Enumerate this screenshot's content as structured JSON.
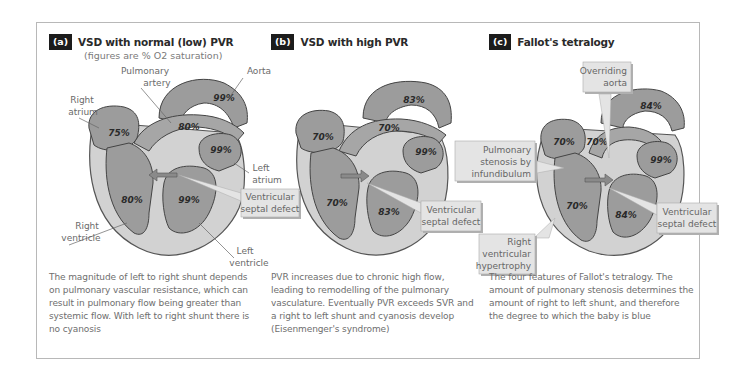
{
  "panels": [
    {
      "badge": "(a)",
      "title": "VSD with normal (low) PVR",
      "subtitle": "(figures are % O2 saturation)",
      "labels": {
        "pulmonary_artery_1": "Pulmonary",
        "pulmonary_artery_2": "artery",
        "aorta": "Aorta",
        "right_atrium_1": "Right",
        "right_atrium_2": "atrium",
        "left_atrium_1": "Left",
        "left_atrium_2": "atrium",
        "vsd_1": "Ventricular",
        "vsd_2": "septal defect",
        "right_ventricle_1": "Right",
        "right_ventricle_2": "ventricle",
        "left_ventricle_1": "Left",
        "left_ventricle_2": "ventricle"
      },
      "values": {
        "aorta": "99%",
        "pulmonary_artery": "80%",
        "right_atrium": "75%",
        "left_atrium": "99%",
        "right_ventricle": "80%",
        "left_ventricle": "99%"
      },
      "shunt_direction": "left-to-right",
      "caption": "The magnitude of left to right shunt depends on pulmonary vascular resistance, which can result in pulmonary flow being greater than systemic flow. With left to right shunt there is no cyanosis"
    },
    {
      "badge": "(b)",
      "title": "VSD with high PVR",
      "labels": {
        "vsd_1": "Ventricular",
        "vsd_2": "septal defect"
      },
      "values": {
        "aorta": "83%",
        "pulmonary_artery": "70%",
        "right_atrium": "70%",
        "left_atrium": "99%",
        "right_ventricle": "70%",
        "left_ventricle": "83%"
      },
      "shunt_direction": "right-to-left",
      "caption": "PVR increases due to chronic high flow, leading to remodelling of the pulmonary vasculature. Eventually PVR exceeds SVR and a right to left shunt and cyanosis develop (Eisenmenger's syndrome)"
    },
    {
      "badge": "(c)",
      "title": "Fallot's tetralogy",
      "labels": {
        "overriding_aorta_1": "Overriding",
        "overriding_aorta_2": "aorta",
        "pulm_stenosis_1": "Pulmonary",
        "pulm_stenosis_2": "stenosis by",
        "pulm_stenosis_3": "infundibulum",
        "vsd_1": "Ventricular",
        "vsd_2": "septal defect",
        "rvh_1": "Right",
        "rvh_2": "ventricular",
        "rvh_3": "hypertrophy"
      },
      "values": {
        "aorta": "84%",
        "pulmonary_artery": "70%",
        "right_atrium": "70%",
        "left_atrium": "99%",
        "right_ventricle": "70%",
        "left_ventricle": "84%"
      },
      "shunt_direction": "right-to-left",
      "caption": "The four features of Fallot's tetralogy. The amount of pulmonary stenosis determines the amount of right to left shunt, and therefore the degree to which the baby is blue"
    }
  ],
  "colors": {
    "chamber": "#9c9c9c",
    "wall": "#d2d2d2",
    "label_box": "#e4e4e4",
    "text": "#6e6e6e"
  }
}
